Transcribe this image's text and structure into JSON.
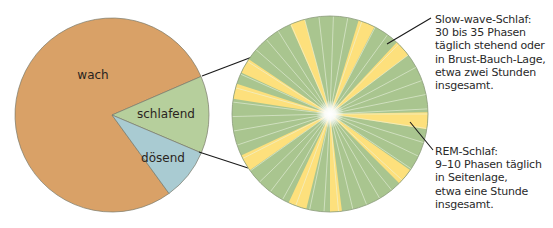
{
  "colors": {
    "wach": "#d9a167",
    "schlafend": "#b6cf9c",
    "doesend": "#a9cbd2",
    "slow_wave": "#a9c58f",
    "rem": "#fde07c",
    "outline": "#7a7a6a",
    "connector": "#1a1a1a"
  },
  "left_pie": {
    "slices": [
      {
        "label": "wach",
        "color_key": "wach"
      },
      {
        "label": "schlafend",
        "color_key": "schlafend"
      },
      {
        "label": "dösend",
        "color_key": "doesend"
      }
    ]
  },
  "right_pie": {
    "segments": [
      "Slow-wave-Schlaf",
      "REM-Schlaf"
    ]
  },
  "annotations": {
    "slow_wave": {
      "lines": [
        "Slow-wave-Schlaf:",
        "30 bis 35 Phasen",
        "täglich stehend oder",
        "in Brust-Bauch-Lage,",
        "etwa zwei Stunden",
        "insgesamt."
      ]
    },
    "rem": {
      "lines": [
        "REM-Schlaf:",
        "9–10 Phasen täglich",
        "in Seitenlage,",
        "etwa eine Stunde",
        "insgesamt."
      ]
    }
  },
  "chart_data": {
    "type": "pie",
    "title": "",
    "charts": [
      {
        "name": "Tagesverteilung",
        "categories": [
          "wach",
          "schlafend",
          "dösend"
        ],
        "values_deg": [
          313,
          46,
          31
        ],
        "values_percent": [
          87,
          13,
          0
        ],
        "approx_share_percent": {
          "wach": 79,
          "schlafend": 13,
          "dösend": 8
        }
      },
      {
        "name": "Schlafphasen (Vergrößerung von 'schlafend')",
        "categories": [
          "Slow-wave-Schlaf",
          "REM-Schlaf"
        ],
        "phases": {
          "Slow-wave-Schlaf": "30 bis 35",
          "REM-Schlaf": "9–10"
        },
        "duration": {
          "Slow-wave-Schlaf": "etwa zwei Stunden",
          "REM-Schlaf": "etwa eine Stunde"
        },
        "rem_wedge_count": 10
      }
    ]
  }
}
